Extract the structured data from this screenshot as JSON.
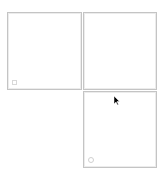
{
  "panels": [
    {
      "id": "top-left",
      "icon": "square-icon"
    },
    {
      "id": "top-right"
    },
    {
      "id": "bottom-right",
      "icon": "circle-icon"
    }
  ],
  "cursor": {
    "icon": "mouse-pointer-icon",
    "x": 115,
    "y": 99
  },
  "colors": {
    "border": "#c4c4c4",
    "background": "#ffffff"
  }
}
